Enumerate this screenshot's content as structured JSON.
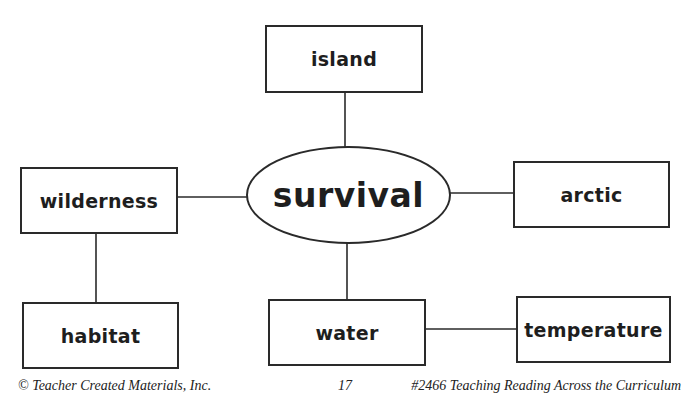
{
  "diagram": {
    "type": "concept-web",
    "center": {
      "label": "survival"
    },
    "nodes": [
      {
        "id": "island",
        "label": "island"
      },
      {
        "id": "wilderness",
        "label": "wilderness"
      },
      {
        "id": "arctic",
        "label": "arctic"
      },
      {
        "id": "habitat",
        "label": "habitat"
      },
      {
        "id": "water",
        "label": "water"
      },
      {
        "id": "temperature",
        "label": "temperature"
      }
    ],
    "edges": [
      [
        "survival",
        "island"
      ],
      [
        "survival",
        "wilderness"
      ],
      [
        "survival",
        "arctic"
      ],
      [
        "survival",
        "water"
      ],
      [
        "wilderness",
        "habitat"
      ],
      [
        "water",
        "temperature"
      ]
    ],
    "line_color": "#2a2a2a"
  },
  "footer": {
    "left": "© Teacher Created Materials, Inc.",
    "page_number": "17",
    "right": "#2466 Teaching Reading Across the Curriculum"
  }
}
